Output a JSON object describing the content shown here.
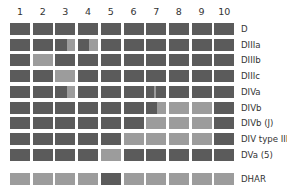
{
  "columns": [
    "1",
    "2",
    "3",
    "4",
    "5",
    "6",
    "7",
    "8",
    "9",
    "10"
  ],
  "colors": {
    "dark": "#5b5b5b",
    "light": "#9c9c9c"
  },
  "rows": [
    {
      "label": "D",
      "cells": [
        "d",
        "d",
        "d",
        "d",
        "d",
        "d",
        "d",
        "d",
        "d",
        "d"
      ]
    },
    {
      "label": "DIIIa",
      "cells": [
        "d",
        "d",
        [
          [
            "d",
            0.6
          ],
          [
            "l",
            0.4
          ]
        ],
        [
          [
            "d",
            0.55
          ],
          [
            "l",
            0.45
          ]
        ],
        "d",
        "d",
        "d",
        "d",
        "d",
        "d"
      ]
    },
    {
      "label": "DIIIb",
      "cells": [
        "d",
        "l",
        "d",
        "d",
        "d",
        "d",
        "d",
        "d",
        "d",
        "d"
      ]
    },
    {
      "label": "DIIIc",
      "cells": [
        "d",
        "d",
        "l",
        "d",
        "d",
        "d",
        "d",
        "d",
        "d",
        "d"
      ]
    },
    {
      "label": "DIVa",
      "cells": [
        "d",
        "d",
        [
          [
            "d",
            0.6
          ],
          [
            "l",
            0.4
          ]
        ],
        "d",
        "d",
        "d",
        [
          [
            "d",
            0.38
          ],
          [
            "l",
            0.1
          ],
          [
            "d",
            0.52
          ]
        ],
        "d",
        "d",
        "d"
      ]
    },
    {
      "label": "DIVb",
      "cells": [
        "d",
        "d",
        "d",
        "d",
        "d",
        "d",
        [
          [
            "d",
            0.55
          ],
          [
            "l",
            0.45
          ]
        ],
        "l",
        "l",
        "d"
      ]
    },
    {
      "label": "DIVb (J)",
      "cells": [
        "d",
        "d",
        "d",
        "d",
        "d",
        "d",
        "l",
        "l",
        "l",
        "d"
      ]
    },
    {
      "label": "DIV type III",
      "cells": [
        "d",
        "d",
        "d",
        "d",
        "d",
        "l",
        "l",
        "l",
        "l",
        "d"
      ]
    },
    {
      "label": "DVa (5)",
      "cells": [
        "d",
        "d",
        "d",
        "d",
        "l",
        "d",
        "d",
        "d",
        "d",
        "d"
      ]
    }
  ],
  "footer_row": {
    "label": "DHAR",
    "cells": [
      "l",
      "l",
      "l",
      "l",
      "d",
      "l",
      "l",
      "l",
      "l",
      "l"
    ]
  }
}
